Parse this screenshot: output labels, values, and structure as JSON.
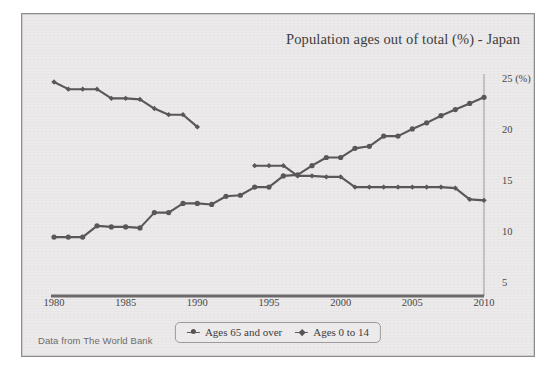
{
  "figure": {
    "title": "Population ages out of total (%) - Japan",
    "source_note": "Data from The World Bank",
    "background_color": "#eceaea",
    "line_color": "#595757",
    "frame_color": "#8e8c8c"
  },
  "chart_data": {
    "type": "line",
    "title": "Population ages out of total (%) - Japan",
    "xlabel": "",
    "ylabel": "",
    "ylim": [
      5,
      25
    ],
    "xlim": [
      1980,
      2010
    ],
    "yticks": [
      5,
      10,
      15,
      20,
      25
    ],
    "ytick_labels": [
      "5",
      "10",
      "15",
      "20",
      "25 (%)"
    ],
    "y_axis_position": "right",
    "xticks": [
      1980,
      1985,
      1990,
      1995,
      2000,
      2005,
      2010
    ],
    "xtick_labels": [
      "1980",
      "1985",
      "1990",
      "1995",
      "2000",
      "2005",
      "2010"
    ],
    "grid": false,
    "legend_position": "bottom-center",
    "x": [
      1980,
      1981,
      1982,
      1983,
      1984,
      1985,
      1986,
      1987,
      1988,
      1989,
      1990,
      1991,
      1992,
      1993,
      1994,
      1995,
      1996,
      1997,
      1998,
      1999,
      2000,
      2001,
      2002,
      2003,
      2004,
      2005,
      2006,
      2007,
      2008,
      2009,
      2010
    ],
    "series": [
      {
        "name": "Ages 65 and over",
        "marker": "circle",
        "values": [
          9.6,
          9.6,
          9.6,
          10.7,
          10.6,
          10.6,
          10.5,
          12.0,
          12.0,
          12.9,
          12.9,
          12.8,
          13.6,
          13.7,
          14.5,
          14.5,
          15.6,
          15.7,
          16.6,
          17.4,
          17.4,
          18.3,
          18.5,
          19.5,
          19.5,
          20.2,
          20.8,
          21.5,
          22.1,
          22.7,
          23.3
        ]
      },
      {
        "name": "Ages 0 to 14",
        "marker": "diamond",
        "values": [
          24.8,
          24.1,
          24.1,
          24.1,
          23.2,
          23.2,
          23.1,
          22.2,
          21.6,
          21.6,
          20.4,
          null,
          null,
          null,
          16.6,
          16.6,
          16.6,
          15.6,
          15.6,
          15.5,
          15.5,
          14.5,
          14.5,
          14.5,
          14.5,
          14.5,
          14.5,
          14.5,
          14.4,
          13.3,
          13.2
        ]
      }
    ]
  },
  "legend": {
    "items": [
      {
        "label": "Ages 65 and over",
        "marker": "circle"
      },
      {
        "label": "Ages 0 to 14",
        "marker": "diamond"
      }
    ]
  }
}
